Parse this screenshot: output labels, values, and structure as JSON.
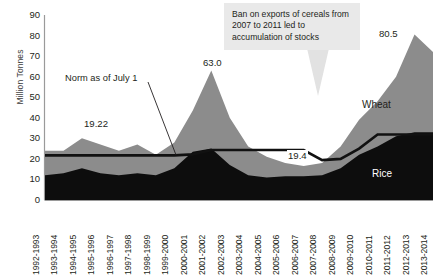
{
  "chart": {
    "ylabel": "Million Tonnes",
    "yticks": [
      0,
      10,
      20,
      30,
      40,
      50,
      60,
      70,
      80,
      90
    ],
    "categories": [
      "1992-1993",
      "1993-1994",
      "1994-1995",
      "1995-1996",
      "1996-1997",
      "1997-1998",
      "1998-1999",
      "1999-2000",
      "2000-2001",
      "2001-2002",
      "2002-2003",
      "2003-2004",
      "2004-2005",
      "2005-2006",
      "2006-2007",
      "2007-2008",
      "2008-2009",
      "2009-2010",
      "2010-2011",
      "2011-2012",
      "2012-2013",
      "2013-2014"
    ],
    "annotations": {
      "callout": "Ban on exports of cereals from 2007 to 2011 led to accumulation of stocks",
      "norm_line": "Norm as of July 1",
      "value_1922": "19.22",
      "value_630": "63.0",
      "value_805": "80.5",
      "value_194": "19.4",
      "series_wheat": "Wheat",
      "series_rice": "Rice"
    },
    "colors": {
      "rice": "#0d0d0d",
      "wheat": "#8c8c8c",
      "norm_line": "#111111",
      "callout_bg": "#e9e9e9",
      "arrow": "#e2e2e2",
      "axis": "#9a9a9a"
    }
  },
  "chart_data": {
    "type": "area",
    "title": "",
    "subtitle": "",
    "xlabel": "",
    "ylabel": "Million Tonnes",
    "ylim": [
      0,
      90
    ],
    "grid": false,
    "legend": "inline-labels",
    "stacked": true,
    "categories": [
      "1992-1993",
      "1993-1994",
      "1994-1995",
      "1995-1996",
      "1996-1997",
      "1997-1998",
      "1998-1999",
      "1999-2000",
      "2000-2001",
      "2001-2002",
      "2002-2003",
      "2003-2004",
      "2004-2005",
      "2005-2006",
      "2006-2007",
      "2007-2008",
      "2008-2009",
      "2009-2010",
      "2010-2011",
      "2011-2012",
      "2012-2013",
      "2013-2014"
    ],
    "series": [
      {
        "name": "Rice",
        "color": "#0d0d0d",
        "values": [
          12.0,
          13.0,
          15.5,
          13.0,
          12.0,
          13.0,
          12.0,
          15.5,
          23.5,
          25.0,
          17.0,
          12.0,
          11.0,
          11.5,
          11.5,
          12.0,
          15.5,
          22.0,
          26.0,
          31.0,
          33.0,
          33.0
        ]
      },
      {
        "name": "Wheat",
        "color": "#8c8c8c",
        "values": [
          12.0,
          11.0,
          14.5,
          14.0,
          12.0,
          14.0,
          10.0,
          12.5,
          20.0,
          38.0,
          23.0,
          14.0,
          10.0,
          6.5,
          5.0,
          6.0,
          10.5,
          17.0,
          22.0,
          29.0,
          47.5,
          39.0
        ]
      }
    ],
    "totals": [
      24.0,
      24.0,
      30.0,
      27.0,
      24.0,
      27.0,
      22.0,
      28.0,
      43.5,
      63.0,
      40.0,
      26.0,
      21.0,
      18.0,
      16.5,
      18.0,
      26.0,
      39.0,
      48.0,
      60.0,
      80.5,
      72.0
    ],
    "reference_line": {
      "name": "Norm as of July 1",
      "color": "#111111",
      "values": [
        21.7,
        21.7,
        21.7,
        21.7,
        21.7,
        21.7,
        21.7,
        21.7,
        22.2,
        24.3,
        24.3,
        24.3,
        24.3,
        24.3,
        24.3,
        19.4,
        20.0,
        25.0,
        31.9,
        31.9,
        31.9,
        31.9
      ],
      "labels": [
        {
          "category": "1996-1997",
          "text": "19.22"
        },
        {
          "category": "2007-2008",
          "text": "19.4"
        }
      ]
    },
    "data_labels": [
      {
        "category": "2001-2002",
        "text": "63.0",
        "value": 63.0
      },
      {
        "category": "2012-2013",
        "text": "80.5",
        "value": 80.5
      }
    ],
    "annotations": [
      {
        "text": "Ban on exports of cereals from 2007 to 2011 led to accumulation of stocks",
        "points_to": "2008-2009"
      },
      {
        "text": "Norm as of July 1",
        "points_to": "1999-2000"
      }
    ]
  }
}
